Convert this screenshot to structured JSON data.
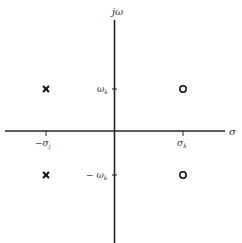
{
  "diagram": {
    "type": "pole-zero plot (s-plane)",
    "axes": {
      "vertical_label": "jω",
      "horizontal_label": "σ"
    },
    "ticks": {
      "omega_pos": "ω",
      "omega_pos_sub": "k",
      "omega_neg": "− ω",
      "omega_neg_sub": "k",
      "sigma_neg": "−σ",
      "sigma_neg_sub": "j",
      "sigma_pos": "σ",
      "sigma_pos_sub": "k"
    },
    "poles": [
      {
        "symbol": "x",
        "position": "(-σj, +ωk)"
      },
      {
        "symbol": "x",
        "position": "(-σj, -ωk)"
      }
    ],
    "zeros": [
      {
        "symbol": "o",
        "position": "(σk, +ωk)"
      },
      {
        "symbol": "o",
        "position": "(σk, -ωk)"
      }
    ]
  }
}
